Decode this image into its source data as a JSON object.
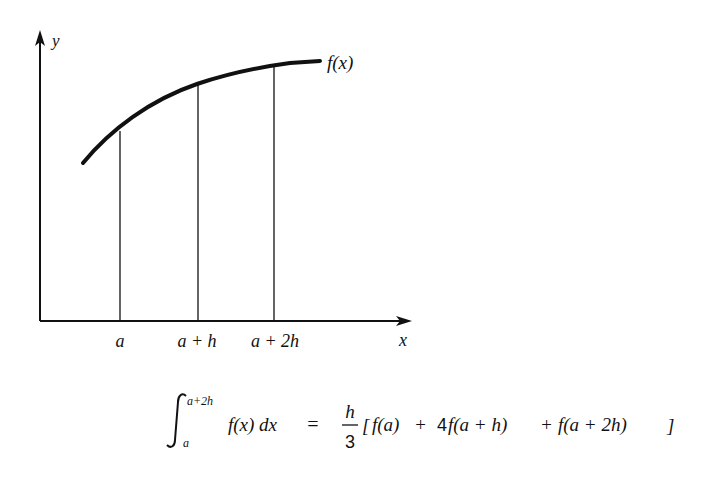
{
  "diagram": {
    "axes": {
      "x_label": "x",
      "y_label": "y"
    },
    "curve_label": "f(x)",
    "tick_labels": [
      {
        "text": "a",
        "x": 120
      },
      {
        "text": "a + h",
        "x": 197
      },
      {
        "text": "a + 2h",
        "x": 274
      }
    ],
    "ordinates": [
      {
        "x": 120,
        "y_top": 131
      },
      {
        "x": 197,
        "y_top": 84
      },
      {
        "x": 274,
        "y_top": 66
      }
    ],
    "colors": {
      "ink": "#111111",
      "background": "#ffffff"
    }
  },
  "formula": {
    "integral_upper": "a+2h",
    "integral_lower": "a",
    "integrand": "f(x) dx",
    "equals": "=",
    "fraction_numerator": "h",
    "fraction_denominator": "3",
    "bracket_open": "[",
    "term1": "f(a)",
    "plus1": "+",
    "coef2": "4",
    "term2": "f(a + h)",
    "plus2": "+",
    "term3": "f(a + 2h)",
    "bracket_close": "]",
    "full_text": "∫_a^(a+2h) f(x) dx = h/3 [ f(a) + 4f(a + h) + f(a + 2h)]"
  }
}
